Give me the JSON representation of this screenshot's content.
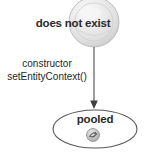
{
  "diagram": {
    "type": "uml-state-diagram",
    "states": [
      {
        "id": "does-not-exist",
        "label": "does not exist",
        "shape": "sphere",
        "fill": "#e8e8e8",
        "stroke": "#a8a8a8"
      },
      {
        "id": "pooled",
        "label": "pooled",
        "shape": "ellipse",
        "fill": "#ffffff",
        "stroke": "#595959",
        "icon": "swirl-circle-icon"
      }
    ],
    "transition": {
      "from": "does-not-exist",
      "to": "pooled",
      "arrow": "down-arrow",
      "lines": [
        "constructor",
        "setEntityContext()"
      ]
    },
    "colors": {
      "text": "#2a2a2a",
      "label_text": "#262626",
      "arrow": "#4d4d4d",
      "sphere_fill": "#e8e8e8",
      "sphere_edge": "#a8a8a8",
      "ellipse_edge": "#595959",
      "background": "#ffffff",
      "icon_fill": "#c2c2c2",
      "icon_edge": "#8a8a8a"
    }
  }
}
